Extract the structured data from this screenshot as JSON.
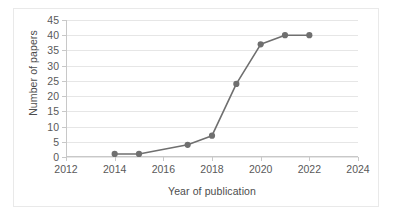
{
  "chart_data": {
    "type": "line",
    "title": "",
    "subtitle": "",
    "xlabel": "Year of publication",
    "ylabel": "Number of papers",
    "xlim": [
      2012,
      2024
    ],
    "ylim": [
      0,
      45
    ],
    "xticks": [
      2012,
      2014,
      2016,
      2018,
      2020,
      2022,
      2024
    ],
    "yticks": [
      0,
      5,
      10,
      15,
      20,
      25,
      30,
      35,
      40,
      45
    ],
    "xtick_labels": [
      "2012",
      "2014",
      "2016",
      "2018",
      "2020",
      "2022",
      "2024"
    ],
    "ytick_labels": [
      "0",
      "5",
      "10",
      "15",
      "20",
      "25",
      "30",
      "35",
      "40",
      "45"
    ],
    "grid": true,
    "grid_axis": "y",
    "legend": false,
    "legend_position": "none",
    "markers": true,
    "x": [
      2014,
      2015,
      2017,
      2018,
      2019,
      2020,
      2021,
      2022
    ],
    "values": [
      1,
      1,
      4,
      7,
      24,
      37,
      40,
      40
    ],
    "series": [
      {
        "name": "Number of papers",
        "x": [
          2014,
          2015,
          2017,
          2018,
          2019,
          2020,
          2021,
          2022
        ],
        "values": [
          1,
          1,
          4,
          7,
          24,
          37,
          40,
          40
        ]
      }
    ],
    "colors": {
      "line": "#6f6f6f",
      "marker": "#6f6f6f",
      "grid": "#e6e6e6",
      "axis": "#c8c8c8",
      "tick_text": "#595959",
      "axis_title": "#4d4d4d",
      "background": "#ffffff",
      "border": "#e9e9e9"
    }
  }
}
